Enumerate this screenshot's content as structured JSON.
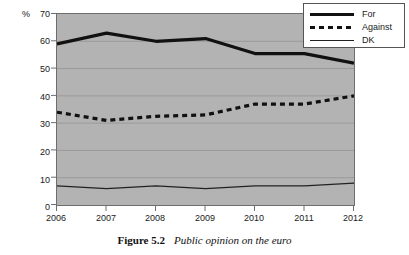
{
  "figure": {
    "caption_number": "Figure 5.2",
    "caption_title": "Public opinion on the euro"
  },
  "axis": {
    "y_unit_label": "%",
    "y_ticks": [
      "70",
      "60",
      "50",
      "40",
      "30",
      "20",
      "10",
      "0"
    ],
    "x_ticks": [
      "2006",
      "2007",
      "2008",
      "2009",
      "2010",
      "2011",
      "2012"
    ]
  },
  "legend": {
    "items": [
      {
        "label": "For",
        "style": "thick-solid",
        "color": "#111111"
      },
      {
        "label": "Against",
        "style": "thick-dashed",
        "color": "#111111"
      },
      {
        "label": "DK",
        "style": "thin-solid",
        "color": "#222222"
      }
    ]
  },
  "colors": {
    "plot_background": "#b3b3b3",
    "gridline": "#9a9a9a",
    "axis": "#6e6e6e",
    "series_for": "#111111",
    "series_against": "#111111",
    "series_dk": "#222222"
  },
  "chart_data": {
    "type": "line",
    "title": "Public opinion on the euro",
    "xlabel": "",
    "ylabel": "%",
    "x": [
      2006,
      2007,
      2008,
      2009,
      2010,
      2011,
      2012
    ],
    "categories": [
      "2006",
      "2007",
      "2008",
      "2009",
      "2010",
      "2011",
      "2012"
    ],
    "xlim": [
      2006,
      2012
    ],
    "ylim": [
      0,
      70
    ],
    "ytick_step": 10,
    "grid": true,
    "legend_position": "top-right",
    "series": [
      {
        "name": "For",
        "values": [
          59,
          63,
          60,
          61,
          55.5,
          55.5,
          52
        ]
      },
      {
        "name": "Against",
        "values": [
          34,
          31,
          32.5,
          33,
          37,
          37,
          40
        ]
      },
      {
        "name": "DK",
        "values": [
          7,
          6,
          7,
          6,
          7,
          7,
          8
        ]
      }
    ]
  }
}
